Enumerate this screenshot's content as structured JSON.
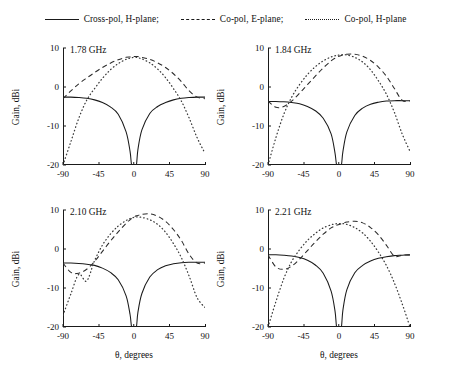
{
  "chart_data": {
    "type": "line",
    "title": "",
    "xlabel": "θ, degrees",
    "ylabel": "Gain, dBi",
    "xlim": [
      -90,
      90
    ],
    "ylim": [
      -20,
      10
    ],
    "xticks": [
      "-90",
      "-45",
      "0",
      "45",
      "90"
    ],
    "xtick_values": [
      -90,
      -45,
      0,
      45,
      90
    ],
    "yticks": [
      "10",
      "0",
      "-10",
      "-20"
    ],
    "ytick_values": [
      10,
      0,
      -10,
      -20
    ],
    "grid": false,
    "legend_position": "top-center",
    "legend": [
      {
        "label": "Cross-pol, H-plane;",
        "style": "solid"
      },
      {
        "label": "Co-pol, E-plane;",
        "style": "dashed"
      },
      {
        "label": "Co-pol, H-plane",
        "style": "dotted"
      }
    ],
    "panels": [
      {
        "title": "1.78 GHz",
        "x": [
          -90,
          -80,
          -70,
          -60,
          -50,
          -40,
          -30,
          -20,
          -10,
          -5,
          -3,
          0,
          3,
          5,
          10,
          20,
          30,
          40,
          50,
          60,
          70,
          80,
          90
        ],
        "series": [
          {
            "name": "Cross-pol, H-plane",
            "style": "solid",
            "values": [
              -2.6,
              -2.6,
              -2.7,
              -2.9,
              -3.3,
              -4.0,
              -5.1,
              -7.0,
              -11.5,
              -16.5,
              -20.0,
              -24.0,
              -20.0,
              -16.0,
              -11.0,
              -6.8,
              -5.0,
              -4.0,
              -3.3,
              -2.9,
              -2.7,
              -2.6,
              -2.6
            ]
          },
          {
            "name": "Co-pol, E-plane",
            "style": "dashed",
            "values": [
              -3.0,
              -1.0,
              0.8,
              2.3,
              3.7,
              5.0,
              6.1,
              7.0,
              7.6,
              7.7,
              7.8,
              7.8,
              7.8,
              7.8,
              7.6,
              7.1,
              6.2,
              5.0,
              3.4,
              1.4,
              -1.0,
              -2.6,
              -3.0
            ]
          },
          {
            "name": "Co-pol, H-plane",
            "style": "dotted",
            "values": [
              -20.0,
              -14.0,
              -8.0,
              -3.4,
              -0.4,
              2.2,
              4.4,
              6.0,
              7.1,
              7.4,
              7.5,
              7.6,
              7.6,
              7.5,
              7.2,
              6.2,
              4.6,
              2.4,
              -0.4,
              -3.6,
              -8.0,
              -13.0,
              -17.0
            ]
          }
        ]
      },
      {
        "title": "1.84 GHz",
        "x": [
          -90,
          -80,
          -70,
          -60,
          -50,
          -40,
          -30,
          -20,
          -10,
          -5,
          -3,
          0,
          3,
          5,
          10,
          20,
          30,
          40,
          50,
          60,
          70,
          80,
          90
        ],
        "series": [
          {
            "name": "Cross-pol, H-plane",
            "style": "solid",
            "values": [
              -3.7,
              -3.7,
              -3.8,
              -4.0,
              -4.3,
              -5.0,
              -6.1,
              -8.0,
              -12.0,
              -17.0,
              -20.0,
              -24.0,
              -20.0,
              -16.5,
              -11.5,
              -7.3,
              -5.4,
              -4.4,
              -3.9,
              -3.6,
              -3.5,
              -3.5,
              -3.5
            ]
          },
          {
            "name": "Co-pol, E-plane",
            "style": "dashed",
            "values": [
              -3.6,
              -5.2,
              -5.0,
              -3.6,
              -1.6,
              0.6,
              2.8,
              4.9,
              6.7,
              7.4,
              7.6,
              7.9,
              8.1,
              8.2,
              8.4,
              8.4,
              7.9,
              6.8,
              5.1,
              2.8,
              -0.3,
              -3.4,
              -3.6
            ]
          },
          {
            "name": "Co-pol, H-plane",
            "style": "dotted",
            "values": [
              -20.0,
              -13.0,
              -7.0,
              -2.6,
              0.6,
              3.2,
              5.2,
              6.7,
              7.7,
              8.0,
              8.1,
              8.2,
              8.3,
              8.3,
              8.2,
              7.6,
              6.4,
              4.4,
              1.6,
              -1.8,
              -6.4,
              -12.0,
              -16.5
            ]
          }
        ]
      },
      {
        "title": "2.10 GHz",
        "x": [
          -90,
          -80,
          -70,
          -60,
          -50,
          -40,
          -30,
          -20,
          -10,
          -5,
          -3,
          0,
          3,
          5,
          10,
          20,
          30,
          40,
          50,
          60,
          70,
          80,
          90
        ],
        "series": [
          {
            "name": "Cross-pol, H-plane",
            "style": "solid",
            "values": [
              -3.6,
              -3.6,
              -3.7,
              -3.9,
              -4.2,
              -4.9,
              -6.0,
              -7.9,
              -12.0,
              -16.8,
              -20.0,
              -23.5,
              -20.0,
              -16.2,
              -11.4,
              -7.2,
              -5.3,
              -4.3,
              -3.8,
              -3.5,
              -3.4,
              -3.4,
              -3.4
            ]
          },
          {
            "name": "Co-pol, E-plane",
            "style": "dashed",
            "values": [
              -3.6,
              -6.0,
              -6.2,
              -5.2,
              -3.2,
              -0.6,
              2.0,
              4.4,
              6.6,
              7.5,
              7.8,
              8.2,
              8.5,
              8.6,
              8.9,
              9.0,
              8.4,
              7.1,
              5.0,
              2.2,
              -1.4,
              -3.6,
              -3.6
            ]
          },
          {
            "name": "Co-pol, H-plane",
            "style": "dotted",
            "values": [
              -17.0,
              -11.5,
              -6.5,
              -8.2,
              -3.0,
              1.0,
              3.8,
              5.9,
              7.3,
              7.8,
              7.9,
              8.1,
              8.2,
              8.2,
              8.1,
              7.5,
              6.3,
              4.3,
              1.4,
              -2.2,
              -7.0,
              -12.5,
              -15.0
            ]
          }
        ]
      },
      {
        "title": "2.21 GHz",
        "x": [
          -90,
          -80,
          -70,
          -60,
          -50,
          -40,
          -30,
          -20,
          -10,
          -5,
          -3,
          0,
          3,
          5,
          10,
          20,
          30,
          40,
          50,
          60,
          70,
          80,
          90
        ],
        "series": [
          {
            "name": "Cross-pol, H-plane",
            "style": "solid",
            "values": [
              -1.5,
              -1.5,
              -1.6,
              -1.8,
              -2.2,
              -2.9,
              -4.1,
              -6.2,
              -10.8,
              -16.0,
              -20.0,
              -24.0,
              -20.0,
              -15.6,
              -10.4,
              -6.1,
              -4.2,
              -3.1,
              -2.4,
              -2.0,
              -1.7,
              -1.6,
              -1.5
            ]
          },
          {
            "name": "Co-pol, E-plane",
            "style": "dashed",
            "values": [
              -1.5,
              -4.6,
              -5.2,
              -4.4,
              -2.6,
              -0.4,
              1.8,
              3.8,
              5.4,
              5.9,
              6.1,
              6.3,
              6.5,
              6.6,
              6.9,
              7.1,
              6.7,
              5.5,
              3.6,
              1.0,
              -1.8,
              -1.6,
              -1.5
            ]
          },
          {
            "name": "Co-pol, H-plane",
            "style": "dotted",
            "values": [
              -20.0,
              -13.5,
              -7.6,
              -3.2,
              -0.2,
              2.2,
              4.0,
              5.4,
              6.2,
              6.4,
              6.5,
              6.5,
              6.5,
              6.5,
              6.3,
              5.5,
              4.1,
              2.0,
              -0.8,
              -4.2,
              -8.6,
              -14.0,
              -20.0
            ]
          }
        ]
      }
    ]
  }
}
